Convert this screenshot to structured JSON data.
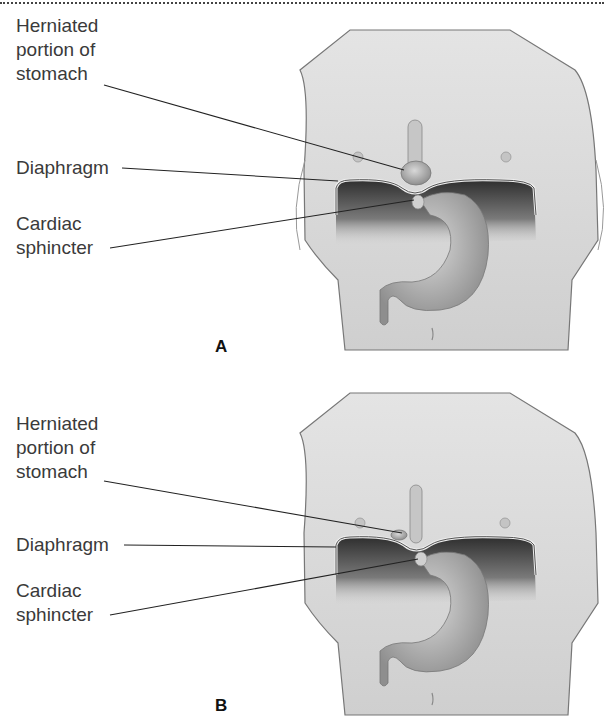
{
  "figure": {
    "panels": [
      {
        "id": "A",
        "letter": "A",
        "labels": {
          "herniated": "Herniated\nportion of\nstomach",
          "diaphragm": "Diaphragm",
          "cardiac": "Cardiac\nsphincter"
        }
      },
      {
        "id": "B",
        "letter": "B",
        "labels": {
          "herniated": "Herniated\nportion of\nstomach",
          "diaphragm": "Diaphragm",
          "cardiac": "Cardiac\nsphincter"
        }
      }
    ],
    "colors": {
      "skin": "#d9d9d9",
      "outline": "#6a6a6a",
      "cavity": "#3c3c3c",
      "stomach": "#bdbdbd",
      "leader": "#222222"
    }
  }
}
